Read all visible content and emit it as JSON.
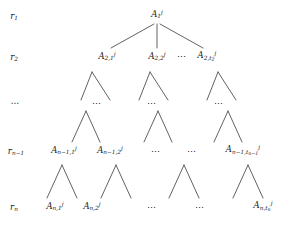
{
  "figure": {
    "type": "tree-diagram",
    "width": 296,
    "height": 226,
    "background_color": "#ffffff",
    "line_color": "#3a3a3a",
    "text_color": "#1a1a1a"
  },
  "row_labels": [
    {
      "id": "r1",
      "text_html": "r<sub>1</sub>",
      "plain": "r_1",
      "x": 14,
      "y": 17
    },
    {
      "id": "r2",
      "text_html": "r<sub>2</sub>",
      "plain": "r_2",
      "x": 14,
      "y": 58
    },
    {
      "id": "rdots",
      "text_html": "⋯",
      "plain": "...",
      "x": 14,
      "y": 103
    },
    {
      "id": "rn1",
      "text_html": "r<sub>n−1</sub>",
      "plain": "r_{n-1}",
      "x": 16,
      "y": 152
    },
    {
      "id": "rn",
      "text_html": "r<sub>n</sub>",
      "plain": "r_n",
      "x": 14,
      "y": 208
    }
  ],
  "nodes": [
    {
      "id": "root",
      "text_html": "A<sub>1</sub><sup>j</sup>",
      "plain": "A_1^j",
      "x": 157,
      "y": 15
    },
    {
      "id": "n2_1",
      "text_html": "A<sub>2,1</sub><sup>j</sup>",
      "plain": "A_{2,1}^j",
      "x": 107,
      "y": 57
    },
    {
      "id": "n2_2",
      "text_html": "A<sub>2,2</sub><sup>j</sup>",
      "plain": "A_{2,2}^j",
      "x": 157,
      "y": 57
    },
    {
      "id": "n2_t2",
      "text_html": "A<sub>2,t<sub>2</sub></sub><sup>j</sup>",
      "plain": "A_{2,t_2}^j",
      "x": 207,
      "y": 57
    },
    {
      "id": "nn1_1",
      "text_html": "A<sub>n−1,1</sub><sup>j</sup>",
      "plain": "A_{n-1,1}^j",
      "x": 64,
      "y": 151
    },
    {
      "id": "nn1_2",
      "text_html": "A<sub>n−1,2</sub><sup>j</sup>",
      "plain": "A_{n-1,2}^j",
      "x": 110,
      "y": 151
    },
    {
      "id": "nn1_t",
      "text_html": "A<sub>n−1,t<sub>n−1</sub></sub><sup>j</sup>",
      "plain": "A_{n-1,t_{n-1}}^j",
      "x": 243,
      "y": 151
    },
    {
      "id": "nn_1",
      "text_html": "A<sub>n,1</sub><sup>j</sup>",
      "plain": "A_{n,1}^j",
      "x": 55,
      "y": 207
    },
    {
      "id": "nn_2",
      "text_html": "A<sub>n,2</sub><sup>j</sup>",
      "plain": "A_{n,2}^j",
      "x": 92,
      "y": 207
    },
    {
      "id": "nn_t",
      "text_html": "A<sub>n,t<sub>n</sub></sub><sup>j</sup>",
      "plain": "A_{n,t_n}^j",
      "x": 263,
      "y": 207
    }
  ],
  "ellipses": [
    {
      "id": "e_row2_mid",
      "text": "⋯",
      "x": 182,
      "y": 57
    },
    {
      "id": "e_lvl3_a",
      "text": "⋯",
      "x": 97,
      "y": 104
    },
    {
      "id": "e_lvl3_b",
      "text": "⋯",
      "x": 152,
      "y": 104
    },
    {
      "id": "e_lvl3_c",
      "text": "⋯",
      "x": 219,
      "y": 104
    },
    {
      "id": "e_rown1_a",
      "text": "⋯",
      "x": 156,
      "y": 152
    },
    {
      "id": "e_rown1_b",
      "text": "⋯",
      "x": 192,
      "y": 152
    },
    {
      "id": "e_rown_a",
      "text": "⋯",
      "x": 152,
      "y": 208
    },
    {
      "id": "e_rown_b",
      "text": "⋯",
      "x": 200,
      "y": 208
    }
  ],
  "edges": [
    {
      "id": "root-to-n2_1",
      "x1": 154,
      "y1": 24,
      "x2": 111,
      "y2": 48
    },
    {
      "id": "root-to-n2_2",
      "x1": 157,
      "y1": 24,
      "x2": 157,
      "y2": 48
    },
    {
      "id": "root-to-n2_t2",
      "x1": 160,
      "y1": 24,
      "x2": 203,
      "y2": 48
    },
    {
      "id": "v1-left",
      "x1": 92,
      "y1": 72,
      "x2": 81,
      "y2": 100
    },
    {
      "id": "v1-right",
      "x1": 92,
      "y1": 72,
      "x2": 110,
      "y2": 100
    },
    {
      "id": "v2-left",
      "x1": 150,
      "y1": 72,
      "x2": 139,
      "y2": 100
    },
    {
      "id": "v2-right",
      "x1": 150,
      "y1": 72,
      "x2": 168,
      "y2": 100
    },
    {
      "id": "v3-left",
      "x1": 218,
      "y1": 72,
      "x2": 207,
      "y2": 100
    },
    {
      "id": "v3-right",
      "x1": 218,
      "y1": 72,
      "x2": 236,
      "y2": 100
    },
    {
      "id": "w1-left",
      "x1": 86,
      "y1": 111,
      "x2": 72,
      "y2": 142
    },
    {
      "id": "w1-right",
      "x1": 86,
      "y1": 111,
      "x2": 100,
      "y2": 142
    },
    {
      "id": "w2-left",
      "x1": 158,
      "y1": 111,
      "x2": 144,
      "y2": 142
    },
    {
      "id": "w2-right",
      "x1": 158,
      "y1": 111,
      "x2": 172,
      "y2": 142
    },
    {
      "id": "w3-left",
      "x1": 228,
      "y1": 111,
      "x2": 214,
      "y2": 142
    },
    {
      "id": "w3-right",
      "x1": 228,
      "y1": 111,
      "x2": 242,
      "y2": 142
    },
    {
      "id": "x1-left",
      "x1": 62,
      "y1": 165,
      "x2": 47,
      "y2": 198
    },
    {
      "id": "x1-right",
      "x1": 62,
      "y1": 165,
      "x2": 77,
      "y2": 198
    },
    {
      "id": "x2-left",
      "x1": 116,
      "y1": 165,
      "x2": 101,
      "y2": 198
    },
    {
      "id": "x2-right",
      "x1": 116,
      "y1": 165,
      "x2": 131,
      "y2": 198
    },
    {
      "id": "x3-left",
      "x1": 184,
      "y1": 165,
      "x2": 169,
      "y2": 198
    },
    {
      "id": "x3-right",
      "x1": 184,
      "y1": 165,
      "x2": 199,
      "y2": 198
    },
    {
      "id": "x4-left",
      "x1": 248,
      "y1": 165,
      "x2": 233,
      "y2": 198
    },
    {
      "id": "x4-right",
      "x1": 248,
      "y1": 165,
      "x2": 263,
      "y2": 198
    }
  ]
}
